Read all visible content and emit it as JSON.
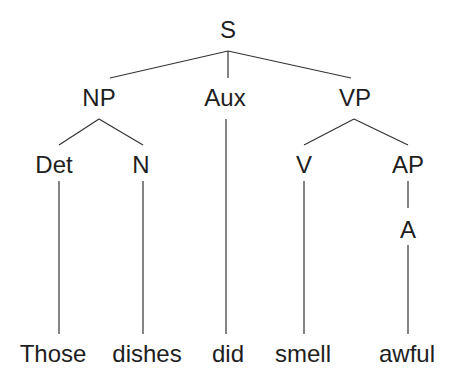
{
  "tree": {
    "nodes": {
      "S": "S",
      "NP": "NP",
      "Aux": "Aux",
      "VP": "VP",
      "Det": "Det",
      "N": "N",
      "V": "V",
      "AP": "AP",
      "A": "A"
    },
    "words": {
      "those": "Those",
      "dishes": "dishes",
      "did": "did",
      "smell": "smell",
      "awful": "awful"
    },
    "line_color": "#333333",
    "text_color": "#1e1e1e"
  }
}
